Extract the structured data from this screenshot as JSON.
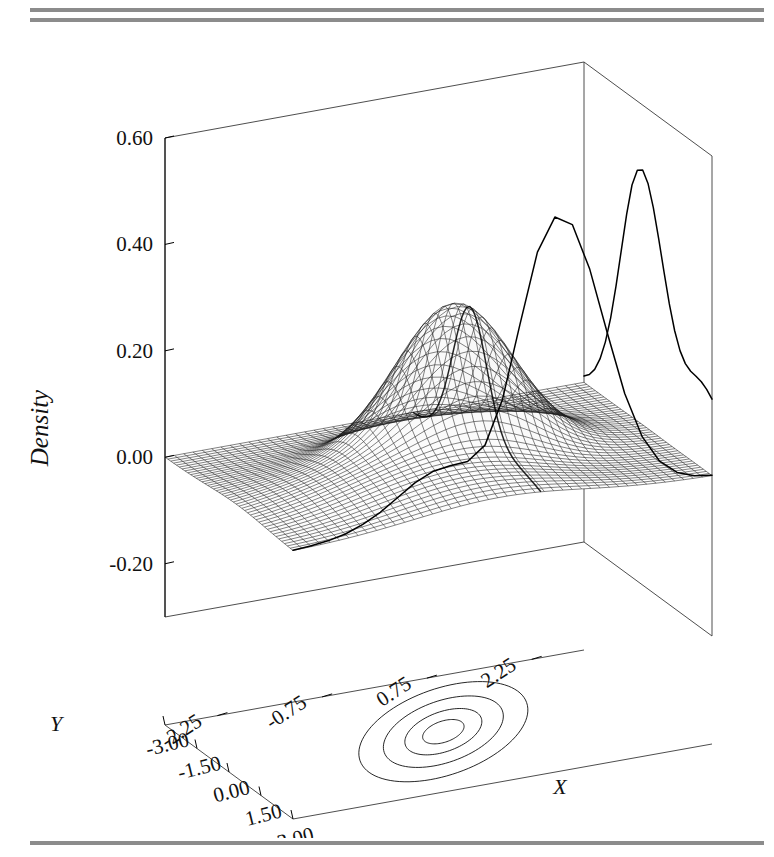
{
  "page": {
    "background": "#ffffff",
    "rule_color": "#8c8c8c",
    "rule_count_top": 2,
    "rule_count_bottom": 1
  },
  "figure": {
    "kind": "3d-perspective-density-surface",
    "line_color": "#000000",
    "surface_fill": "#d8d8d8",
    "mesh_color": "#1c1c1c"
  },
  "axes": {
    "z": {
      "title": "Density",
      "ticks": [
        "0.60",
        "0.40",
        "0.20",
        "0.00",
        "-0.20"
      ],
      "values": [
        0.6,
        0.4,
        0.2,
        0.0,
        -0.2
      ],
      "range": [
        -0.3,
        0.6
      ]
    },
    "y": {
      "title": "Y",
      "ticks": [
        "2.25",
        "0.75",
        "-0.75",
        "-2.25"
      ],
      "values": [
        2.25,
        0.75,
        -0.75,
        -2.25
      ],
      "range": [
        -3.0,
        3.0
      ]
    },
    "x": {
      "title": "X",
      "ticks": [
        "-3.00",
        "-1.50",
        "0.00",
        "1.50",
        "3.00"
      ],
      "values": [
        -3.0,
        -1.5,
        0.0,
        1.5,
        3.0
      ],
      "range": [
        -3.0,
        3.0
      ]
    }
  },
  "chart_data": {
    "type": "surface",
    "title": "",
    "xlabel": "X",
    "ylabel": "Y",
    "zlabel": "Density",
    "xlim": [
      -3.0,
      3.0
    ],
    "ylim": [
      -3.0,
      3.0
    ],
    "zlim": [
      -0.3,
      0.6
    ],
    "grid": false,
    "legend": "none",
    "surface": {
      "mesh_nx": 45,
      "mesh_ny": 45,
      "peak_density": 0.29,
      "components": [
        {
          "name": "main-peak",
          "weight": 0.62,
          "mean_x": -0.35,
          "mean_y": 0.35,
          "sd_x": 0.8,
          "sd_y": 0.8,
          "rho": 0.05
        },
        {
          "name": "shoulder",
          "weight": 0.38,
          "mean_x": 1.35,
          "mean_y": -0.55,
          "sd_x": 1.45,
          "sd_y": 1.3,
          "rho": 0.35
        }
      ]
    },
    "back_wall_curve": {
      "name": "marginal-density-x",
      "axis": "X",
      "peak_value": 0.48,
      "peak_at": -0.35,
      "x": [
        -3.0,
        -2.75,
        -2.5,
        -2.25,
        -2.0,
        -1.75,
        -1.5,
        -1.25,
        -1.0,
        -0.75,
        -0.5,
        -0.25,
        0.0,
        0.25,
        0.5,
        0.75,
        1.0,
        1.25,
        1.5,
        1.75,
        2.0,
        2.25,
        2.5,
        2.75,
        3.0
      ],
      "y": [
        0.012,
        0.022,
        0.039,
        0.066,
        0.105,
        0.158,
        0.225,
        0.3,
        0.375,
        0.437,
        0.472,
        0.48,
        0.462,
        0.424,
        0.373,
        0.318,
        0.265,
        0.222,
        0.192,
        0.175,
        0.168,
        0.166,
        0.163,
        0.156,
        0.145
      ]
    },
    "right_wall_curve": {
      "name": "marginal-density-y",
      "axis": "Y",
      "peak_value": 0.54,
      "peak_at": 0.6,
      "y": [
        -3.0,
        -2.75,
        -2.5,
        -2.25,
        -2.0,
        -1.75,
        -1.5,
        -1.25,
        -1.0,
        -0.75,
        -0.5,
        -0.25,
        0.0,
        0.25,
        0.5,
        0.75,
        1.0,
        1.25,
        1.5,
        1.75,
        2.0,
        2.25,
        2.5,
        2.75,
        3.0
      ],
      "z": [
        0.002,
        0.004,
        0.008,
        0.015,
        0.027,
        0.044,
        0.066,
        0.088,
        0.103,
        0.108,
        0.11,
        0.135,
        0.215,
        0.35,
        0.48,
        0.54,
        0.52,
        0.43,
        0.305,
        0.185,
        0.098,
        0.046,
        0.019,
        0.007,
        0.002
      ]
    },
    "contours": {
      "name": "floor-contours",
      "count": 4,
      "levels": [
        0.04,
        0.1,
        0.17,
        0.24
      ],
      "center_x": -0.1,
      "center_y": 0.1,
      "orientation_deg": -26,
      "semi_major": [
        2.55,
        1.82,
        1.18,
        0.62
      ],
      "semi_minor": [
        1.1,
        0.78,
        0.5,
        0.27
      ]
    }
  }
}
